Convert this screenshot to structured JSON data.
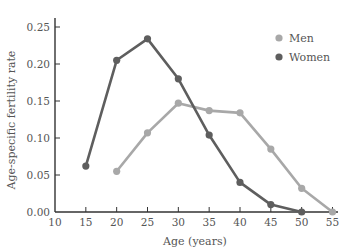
{
  "chart_data": {
    "type": "line",
    "title": "",
    "xlabel": "Age (years)",
    "ylabel": "Age-specific fertility rate",
    "xlim": [
      10,
      55
    ],
    "ylim": [
      0,
      0.25
    ],
    "xticks": [
      "10",
      "15",
      "20",
      "25",
      "30",
      "35",
      "40",
      "45",
      "50",
      "55"
    ],
    "yticks": [
      "0.00",
      "0.05",
      "0.10",
      "0.15",
      "0.20",
      "0.25"
    ],
    "grid": false,
    "legend_position": "upper right",
    "series": [
      {
        "name": "Men",
        "color": "#a8a8a8",
        "x": [
          20,
          25,
          30,
          35,
          40,
          45,
          50,
          55
        ],
        "values": [
          0.055,
          0.107,
          0.147,
          0.137,
          0.134,
          0.085,
          0.032,
          0.0
        ]
      },
      {
        "name": "Women",
        "color": "#5e5e5e",
        "x": [
          15,
          20,
          25,
          30,
          35,
          40,
          45,
          50
        ],
        "values": [
          0.062,
          0.205,
          0.234,
          0.18,
          0.104,
          0.04,
          0.01,
          0.0
        ]
      }
    ]
  }
}
